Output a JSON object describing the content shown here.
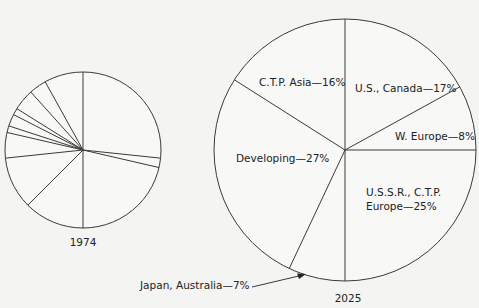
{
  "chart_data": [
    {
      "type": "pie",
      "title": "1974",
      "center": [
        83,
        150
      ],
      "radius": 78,
      "spoke_angles_deg": [
        0,
        96,
        103,
        180,
        225,
        264,
        283,
        288,
        297,
        302,
        318,
        331
      ],
      "labels": [],
      "note": "Unlabeled 1974 slices; one large share plus many small slices"
    },
    {
      "type": "pie",
      "title": "2025",
      "center": [
        345,
        150
      ],
      "radius": 131,
      "categories": [
        "U.S., Canada",
        "W. Europe",
        "U.S.S.R., C.T.P. Europe",
        "Japan, Australia",
        "Developing",
        "C.T.P. Asia"
      ],
      "values": [
        17,
        8,
        25,
        7,
        27,
        16
      ],
      "unit": "%",
      "labels": [
        {
          "text": "U.S., Canada—17%",
          "x": 355,
          "y": 92
        },
        {
          "text": "W. Europe—8%",
          "x": 395,
          "y": 140
        },
        {
          "text": "U.S.S.R., C.T.P.",
          "x": 366,
          "y": 196
        },
        {
          "text": "Europe—25%",
          "x": 366,
          "y": 210
        },
        {
          "text": "Developing—27%",
          "x": 236,
          "y": 162
        },
        {
          "text": "C.T.P. Asia—16%",
          "x": 259,
          "y": 86
        },
        {
          "text": "Japan, Australia—7%",
          "x": 140,
          "y": 289
        }
      ]
    }
  ],
  "captions": {
    "left_year": "1974",
    "right_year": "2025"
  }
}
